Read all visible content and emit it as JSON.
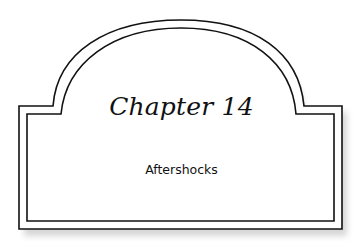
{
  "chapter": {
    "title": "Chapter 14",
    "subtitle": "Aftershocks"
  },
  "colors": {
    "stroke": "#111111",
    "shadow": "#cfcfcf",
    "background": "#ffffff"
  }
}
